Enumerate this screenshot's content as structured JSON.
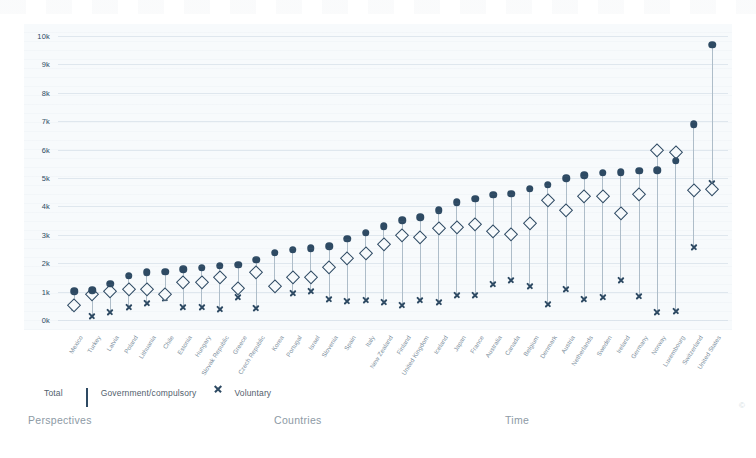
{
  "chart_data": {
    "type": "scatter",
    "title": "",
    "xlabel": "",
    "ylabel": "",
    "ylim": [
      0,
      10000
    ],
    "yticks": [
      0,
      1000,
      2000,
      3000,
      4000,
      5000,
      6000,
      7000,
      8000,
      9000,
      10000
    ],
    "ytick_labels": [
      "0k",
      "1k",
      "2k",
      "3k",
      "4k",
      "5k",
      "6k",
      "7k",
      "8k",
      "9k",
      "10k"
    ],
    "grid": true,
    "legend_position": "below-left",
    "categories": [
      "Mexico",
      "Turkey",
      "Latvia",
      "Poland",
      "Lithuania",
      "Chile",
      "Estonia",
      "Hungary",
      "Slovak Republic",
      "Greece",
      "Czech Republic",
      "Korea",
      "Portugal",
      "Israel",
      "Slovenia",
      "Spain",
      "Italy",
      "New Zealand",
      "Finland",
      "United Kingdom",
      "Iceland",
      "Japan",
      "France",
      "Australia",
      "Canada",
      "Belgium",
      "Denmark",
      "Austria",
      "Netherlands",
      "Sweden",
      "Ireland",
      "Germany",
      "Norway",
      "Luxembourg",
      "Switzerland",
      "United States"
    ],
    "series": [
      {
        "name": "Total",
        "marker": "filled-circle",
        "color": "#2e4a63",
        "values": [
          1010,
          1040,
          1280,
          1560,
          1680,
          1700,
          1780,
          1840,
          1910,
          1940,
          2120,
          2370,
          2480,
          2530,
          2600,
          2860,
          3070,
          3300,
          3520,
          3620,
          3870,
          4150,
          4270,
          4410,
          4450,
          4620,
          4770,
          4990,
          5100,
          5180,
          5200,
          5250,
          5280,
          5600,
          6900,
          9700
        ]
      },
      {
        "name": "Government/compulsory",
        "marker": "open-diamond",
        "color": "#2e4a63",
        "values": [
          520,
          910,
          1020,
          1080,
          1080,
          930,
          1340,
          1350,
          1520,
          1120,
          1700,
          1200,
          1500,
          1530,
          1870,
          2190,
          2350,
          2680,
          2980,
          2940,
          3230,
          3290,
          3390,
          3150,
          3040,
          3430,
          4220,
          3890,
          4380,
          4370,
          3770,
          4420,
          5990,
          5930,
          4570,
          4610
        ]
      },
      {
        "name": "Voluntary",
        "marker": "x",
        "color": "#2e4a63",
        "values": [
          460,
          130,
          280,
          470,
          590,
          760,
          450,
          470,
          390,
          820,
          430,
          1160,
          960,
          1010,
          740,
          670,
          720,
          630,
          540,
          690,
          650,
          870,
          880,
          1260,
          1400,
          1190,
          560,
          1090,
          730,
          810,
          1420,
          830,
          280,
          300,
          2580,
          4810
        ]
      }
    ]
  },
  "legend": {
    "items": [
      {
        "label": "Total",
        "icon": "filled-circle-icon"
      },
      {
        "label": "Government/compulsory",
        "icon": "open-diamond-icon"
      },
      {
        "label": "Voluntary",
        "icon": "x-mark-icon"
      }
    ]
  },
  "tabs": [
    {
      "label": "Perspectives",
      "left": 28
    },
    {
      "label": "Countries",
      "left": 274
    },
    {
      "label": "Time",
      "left": 505
    }
  ],
  "footer": {
    "copyright": "©"
  }
}
